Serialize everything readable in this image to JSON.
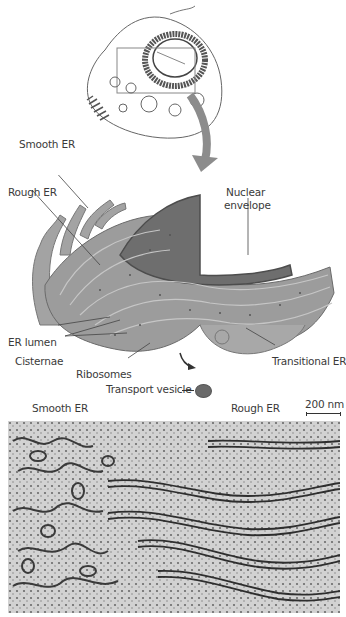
{
  "figure": {
    "cell_overview": {
      "description": "Outline of animal cell with boxed region around ER near nucleus"
    },
    "illustration": {
      "labels": {
        "smooth_er": "Smooth ER",
        "rough_er": "Rough ER",
        "nuclear_envelope_line1": "Nuclear",
        "nuclear_envelope_line2": "envelope",
        "er_lumen": "ER lumen",
        "cisternae": "Cisternae",
        "ribosomes": "Ribosomes",
        "transitional_er": "Transitional ER",
        "transport_vesicle": "Transport vesicle"
      }
    },
    "micrograph": {
      "labels": {
        "smooth_er": "Smooth ER",
        "rough_er": "Rough ER"
      },
      "scale_bar": "200 nm"
    },
    "colors": {
      "er_fill": "#9a9a9a",
      "nucleus_fill": "#6e6e6e",
      "arrow": "#8c8c8c",
      "micrograph_bg": "#cfcfcf"
    }
  }
}
